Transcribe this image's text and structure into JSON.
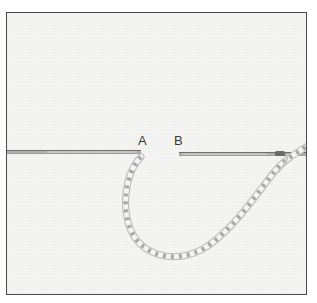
{
  "figure": {
    "labels": {
      "point_a": "A",
      "point_b": "B"
    },
    "colors": {
      "fabric": "#f3f3f1",
      "border": "#4a4a4a",
      "needle": "#8a8a8a",
      "thread_light": "#f4f4f4",
      "thread_shadow": "#b8b8b8"
    }
  }
}
